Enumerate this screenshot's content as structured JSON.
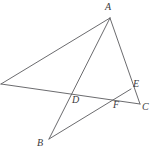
{
  "figure": {
    "canvas": {
      "width": 158,
      "height": 159,
      "background": "#ffffff"
    },
    "style": {
      "line_color": "#5a5a5e",
      "line_width": 0.9,
      "label_color": "#3a3a3c",
      "label_font_size": 10
    },
    "points": [
      {
        "id": "A",
        "label": "A",
        "x": 110,
        "y": 18,
        "label_x": 105,
        "label_y": 2,
        "labeled": true
      },
      {
        "id": "B",
        "label": "B",
        "x": 49,
        "y": 139,
        "label_x": 37,
        "label_y": 138,
        "labeled": true
      },
      {
        "id": "C",
        "label": "C",
        "x": 140,
        "y": 104,
        "label_x": 142,
        "label_y": 102,
        "labeled": true
      },
      {
        "id": "D",
        "label": "D",
        "x": 77,
        "y": 96,
        "label_x": 72,
        "label_y": 95,
        "labeled": true
      },
      {
        "id": "E",
        "label": "E",
        "x": 131,
        "y": 89,
        "label_x": 133,
        "label_y": 79,
        "labeled": true
      },
      {
        "id": "F",
        "label": "F",
        "x": 117,
        "y": 100,
        "label_x": 113,
        "label_y": 100,
        "labeled": true
      },
      {
        "id": "G",
        "label": "",
        "x": 1,
        "y": 84,
        "label_x": 0,
        "label_y": 0,
        "labeled": false
      }
    ],
    "segments": [
      {
        "id": "seg-G-A",
        "from": "G",
        "to": "A",
        "description": "left vertex to apex A"
      },
      {
        "id": "seg-G-C",
        "from": "G",
        "to": "C",
        "description": "left vertex through D and F to C"
      },
      {
        "id": "seg-A-C",
        "from": "A",
        "to": "C",
        "description": "apex A through E to C"
      },
      {
        "id": "seg-A-B",
        "from": "A",
        "to": "B",
        "description": "apex A through D to B"
      },
      {
        "id": "seg-B-E",
        "from": "B",
        "to": "E",
        "description": "B through F to E"
      }
    ]
  }
}
